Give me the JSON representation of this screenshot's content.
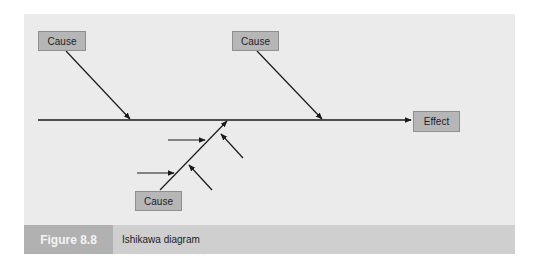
{
  "diagram": {
    "type": "ishikawa",
    "causes": [
      {
        "id": "cause-1",
        "label": "Cause",
        "position": "top-left"
      },
      {
        "id": "cause-2",
        "label": "Cause",
        "position": "top-right"
      },
      {
        "id": "cause-3",
        "label": "Cause",
        "position": "bottom",
        "sub_causes": 4
      }
    ],
    "effect": {
      "label": "Effect"
    },
    "colors": {
      "frame_bg": "#ebebeb",
      "box_fill": "#b6b6b6",
      "box_border": "#8f8f8f",
      "line": "#1a1a1a",
      "caption_label_bg": "#b1b1b1",
      "caption_title_bg": "#cfcfcf"
    }
  },
  "caption": {
    "figure_label": "Figure 8.8",
    "title": "Ishikawa diagram"
  }
}
